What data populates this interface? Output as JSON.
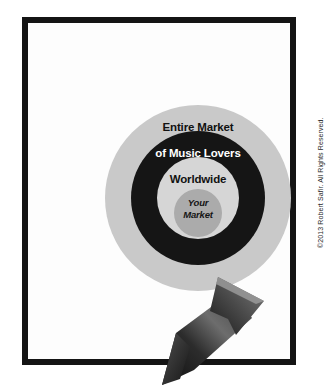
{
  "document": {
    "background_color": "#ffffff",
    "frame": {
      "name": "black-picture-frame",
      "border_color": "#141414",
      "fill_color": "#fdfdfd"
    }
  },
  "diagram": {
    "type": "concentric-target",
    "title": "Entire Market of Music Lovers Worldwide",
    "rings": [
      {
        "name": "outer-ring",
        "label": "Entire Market",
        "fill": "#c9c9c9",
        "text_color": "#111111"
      },
      {
        "name": "middle-ring",
        "label": "of Music Lovers",
        "fill": "#151515",
        "text_color": "#ffffff"
      },
      {
        "name": "inner-ring",
        "label": "Worldwide",
        "fill": "#d6d6d6",
        "text_color": "#111111"
      },
      {
        "name": "bullseye",
        "label": "Your Market",
        "fill": "#ababab",
        "text_color": "#151515"
      }
    ],
    "labels": {
      "entire_market": "Entire Market",
      "of_music_lovers": "of Music Lovers",
      "worldwide": "Worldwide",
      "your_market_line1": "Your",
      "your_market_line2": "Market"
    },
    "arrow": {
      "name": "pointer-arrow",
      "direction": "up-right",
      "points_to": "Your Market",
      "fill_dark": "#1d1d1d",
      "fill_light": "#8e8e8e"
    }
  },
  "footer": {
    "copyright": "©2013 Robert Safir. All Rights Reserved."
  }
}
